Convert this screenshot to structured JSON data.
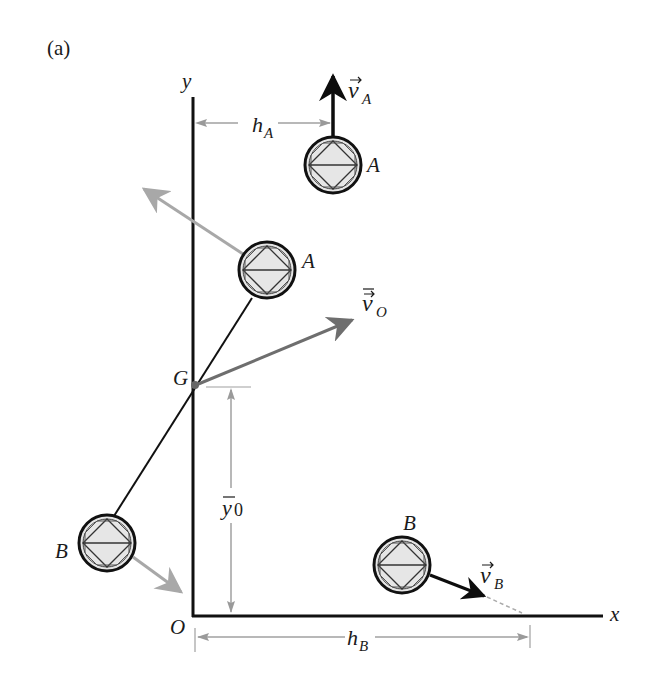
{
  "figure": {
    "panel_label": "(a)",
    "axes": {
      "x_label": "x",
      "y_label": "y",
      "origin_label": "O"
    },
    "points": {
      "center_of_mass_label": "G"
    },
    "masses": {
      "A_label": "A",
      "B_label": "B"
    },
    "vectors": {
      "vA": {
        "symbol": "v",
        "subscript": "A"
      },
      "vB": {
        "symbol": "v",
        "subscript": "B"
      },
      "vO": {
        "symbol": "v",
        "subscript": "O"
      }
    },
    "dimensions": {
      "hA": {
        "symbol": "h",
        "subscript": "A"
      },
      "hB": {
        "symbol": "h",
        "subscript": "B"
      },
      "y0": {
        "symbol": "y",
        "subscript": "0"
      }
    },
    "colors": {
      "axis": "#111111",
      "gray_arrow": "#a8a8a8",
      "dark_gray_arrow": "#6e6e6e",
      "sphere_fill": "#e6e6e6",
      "black_arrow": "#0d0d0d"
    }
  }
}
